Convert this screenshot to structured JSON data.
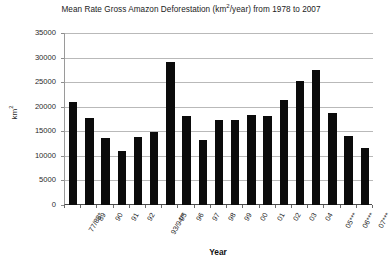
{
  "chart_data": {
    "type": "bar",
    "title": "Mean Rate Gross Amazon Deforestation (km2/year) from 1978 to 2007",
    "title_main": "Mean Rate Gross Amazon Deforestation (km",
    "title_sup": "2",
    "title_tail": "/year) from 1978 to 2007",
    "xlabel": "Year",
    "ylabel": "km2",
    "ylabel_main": "km",
    "ylabel_sup": "2",
    "ylim": [
      0,
      35000
    ],
    "yticks": [
      0,
      5000,
      10000,
      15000,
      20000,
      25000,
      30000,
      35000
    ],
    "ytick_labels": [
      "0",
      "5000",
      "10000",
      "15000",
      "20000",
      "25000",
      "30000",
      "35000"
    ],
    "grid": true,
    "legend": "none",
    "bar_color": "#0b0b0b",
    "categories": [
      "77/88*",
      "89",
      "90",
      "91",
      "92",
      "93/94**",
      "95",
      "96",
      "97",
      "98",
      "99",
      "00",
      "01",
      "02",
      "03",
      "04",
      "05***",
      "06***",
      "07***"
    ],
    "values": [
      21050,
      17770,
      13730,
      11030,
      13790,
      14900,
      29060,
      18160,
      13230,
      17380,
      17260,
      18230,
      18170,
      21400,
      25250,
      27450,
      18700,
      14000,
      11530
    ]
  }
}
